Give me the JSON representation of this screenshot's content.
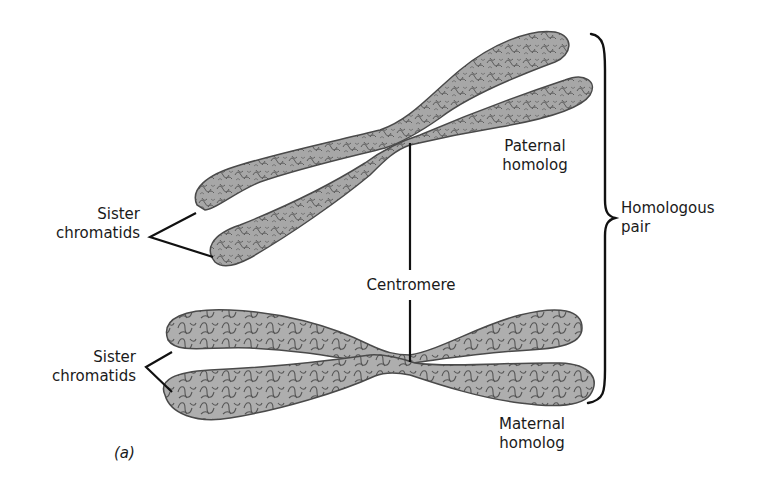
{
  "figure": {
    "panel_label": "(a)",
    "colors": {
      "chromatid_fill": "#a7a7a7",
      "chromatid_outline": "#4a4a4a",
      "chromatin_loops": "#5c5c5c",
      "leader_lines": "#111111",
      "text": "#1a1a1a",
      "background": "#ffffff"
    }
  },
  "labels": {
    "sister_chromatids_top": {
      "line1": "Sister",
      "line2": "chromatids"
    },
    "sister_chromatids_bottom": {
      "line1": "Sister",
      "line2": "chromatids"
    },
    "paternal_homolog": {
      "line1": "Paternal",
      "line2": "homolog"
    },
    "maternal_homolog": {
      "line1": "Maternal",
      "line2": "homolog"
    },
    "centromere": "Centromere",
    "homologous_pair": {
      "line1": "Homologous",
      "line2": "pair"
    }
  },
  "structures": {
    "paternal_chromosome": {
      "name": "Paternal homolog",
      "chromatids": 2,
      "orientation": "diagonal"
    },
    "maternal_chromosome": {
      "name": "Maternal homolog",
      "chromatids": 2,
      "orientation": "horizontal"
    }
  }
}
